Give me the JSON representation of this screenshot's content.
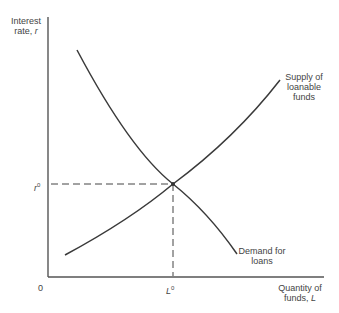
{
  "diagram": {
    "type": "supply-demand",
    "y_axis": {
      "label_line1": "Interest",
      "label_line2": "rate, ",
      "label_var": "r"
    },
    "x_axis": {
      "label_line1": "Quantity of",
      "label_line2": "funds, ",
      "label_var": "L"
    },
    "origin_label": "0",
    "equilibrium": {
      "rate_label": "r",
      "rate_sup": "0",
      "quantity_label": "L",
      "quantity_sup": "0"
    },
    "curves": [
      {
        "name": "supply",
        "label_lines": [
          "Supply of",
          "loanable",
          "funds"
        ]
      },
      {
        "name": "demand",
        "label_lines": [
          "Demand for",
          "loans"
        ]
      }
    ],
    "colors": {
      "line": "#3a3a3a",
      "axis": "#555555"
    }
  }
}
